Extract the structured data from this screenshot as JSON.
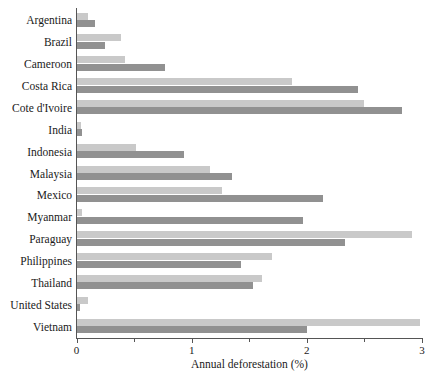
{
  "chart_data": {
    "type": "bar",
    "orientation": "horizontal",
    "title": "",
    "xlabel": "Annual deforestation (%)",
    "ylabel": "",
    "xlim": [
      0,
      3
    ],
    "xticks": [
      0,
      1,
      2,
      3
    ],
    "xtick_labels": [
      "0",
      "1",
      "2",
      "3"
    ],
    "minor_xticks": [
      0.5,
      1.5,
      2.5
    ],
    "grid": false,
    "legend": "none",
    "categories": [
      "Argentina",
      "Brazil",
      "Cameroon",
      "Costa Rica",
      "Cote d'Ivoire",
      "India",
      "Indonesia",
      "Malaysia",
      "Mexico",
      "Myanmar",
      "Paraguay",
      "Philippines",
      "Thailand",
      "United States",
      "Vietnam"
    ],
    "series": [
      {
        "name": "light",
        "color": "#c9c9c9",
        "values": [
          0.1,
          0.39,
          0.42,
          1.87,
          2.5,
          0.04,
          0.52,
          1.16,
          1.26,
          0.05,
          2.91,
          1.7,
          1.61,
          0.1,
          2.98
        ]
      },
      {
        "name": "dark",
        "color": "#919191",
        "values": [
          0.16,
          0.25,
          0.77,
          2.44,
          2.83,
          0.05,
          0.93,
          1.35,
          2.14,
          1.97,
          2.33,
          1.43,
          1.53,
          0.03,
          2.0
        ]
      }
    ]
  }
}
